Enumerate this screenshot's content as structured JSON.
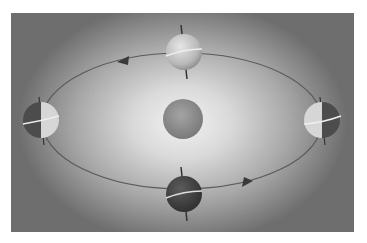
{
  "diagram": {
    "title": "",
    "colors": {
      "background_center": "#f2f2f2",
      "background_edge": "#6e6e6e",
      "orbit": "#5a5a5a",
      "sun": "#8e8e8e",
      "earth_lit": "#d8d8d8",
      "earth_dark": "#4a4a4a",
      "equator": "#e8e8e8",
      "arrow": "#3a3a3a"
    },
    "sun": {
      "label": ""
    },
    "earths": [
      {
        "position": "top",
        "illumination": "fully-lit"
      },
      {
        "position": "right",
        "illumination": "left-half-lit"
      },
      {
        "position": "bottom",
        "illumination": "dark"
      },
      {
        "position": "left",
        "illumination": "right-half-lit"
      }
    ],
    "arrows": [
      {
        "position": "upper-left",
        "direction": "counter-clockwise"
      },
      {
        "position": "lower-right",
        "direction": "counter-clockwise"
      }
    ]
  }
}
